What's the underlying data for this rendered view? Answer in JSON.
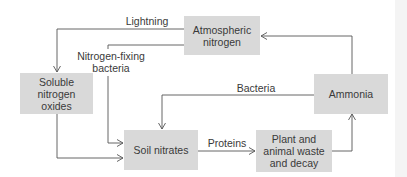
{
  "diagram": {
    "nodes": {
      "atmospheric": "Atmospheric\nnitrogen",
      "soluble": "Soluble\nnitrogen\noxides",
      "ammonia": "Ammonia",
      "soil": "Soil nitrates",
      "plant": "Plant and\nanimal waste\nand decay"
    },
    "edge_labels": {
      "lightning": "Lightning",
      "nitrogen_fixing": "Nitrogen-fixing\nbacteria",
      "bacteria": "Bacteria",
      "proteins": "Proteins"
    },
    "edges": [
      {
        "from": "Atmospheric nitrogen",
        "to": "Soluble nitrogen oxides",
        "label": "Lightning"
      },
      {
        "from": "Atmospheric nitrogen",
        "to": "Soil nitrates",
        "label": "Nitrogen-fixing bacteria"
      },
      {
        "from": "Soluble nitrogen oxides",
        "to": "Soil nitrates",
        "label": ""
      },
      {
        "from": "Ammonia",
        "to": "Soil nitrates",
        "label": "Bacteria"
      },
      {
        "from": "Ammonia",
        "to": "Atmospheric nitrogen",
        "label": ""
      },
      {
        "from": "Soil nitrates",
        "to": "Plant and animal waste and decay",
        "label": "Proteins"
      },
      {
        "from": "Plant and animal waste and decay",
        "to": "Ammonia",
        "label": ""
      }
    ],
    "colors": {
      "box_fill": "#d9d9d9",
      "line": "#555555",
      "text": "#3a3a3a"
    }
  }
}
